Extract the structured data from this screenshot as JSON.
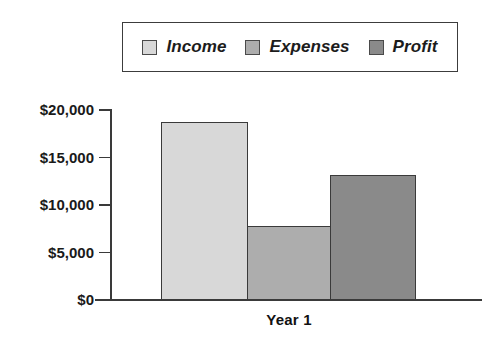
{
  "chart_data": {
    "type": "bar",
    "title": "",
    "subtitle": "",
    "xlabel": "Year 1",
    "ylabel": "",
    "categories": [
      "Year 1"
    ],
    "series": [
      {
        "name": "Income",
        "values": [
          18700
        ],
        "color": "#d8d8d8"
      },
      {
        "name": "Expenses",
        "values": [
          7800
        ],
        "color": "#adadad"
      },
      {
        "name": "Profit",
        "values": [
          13200
        ],
        "color": "#8a8a8a"
      }
    ],
    "ylim": [
      0,
      20000
    ],
    "y_tick_values": [
      0,
      5000,
      10000,
      15000,
      20000
    ],
    "y_tick_labels": [
      "$0",
      "$5,000",
      "$10,000",
      "$15,000",
      "$20,000"
    ],
    "x_tick_labels": [
      "Year 1"
    ],
    "grid": false,
    "legend_position": "top",
    "annotations": []
  },
  "legend": {
    "entries": [
      {
        "label": "Income",
        "swatch_color": "#d8d8d8",
        "swatch_name": "legend-swatch-income"
      },
      {
        "label": "Expenses",
        "swatch_color": "#adadad",
        "swatch_name": "legend-swatch-expenses"
      },
      {
        "label": "Profit",
        "swatch_color": "#8a8a8a",
        "swatch_name": "legend-swatch-profit"
      }
    ]
  },
  "axes": {
    "y_labels": [
      "$20,000",
      "$15,000",
      "$10,000",
      "$5,000",
      "$0"
    ],
    "x_label": "Year 1"
  },
  "colors": {
    "background": "#ffffff",
    "axis": "#3a3a3a",
    "text": "#1a1a1a",
    "legend_border": "#3c3c3c",
    "bar_border": "#3a3a3a"
  }
}
